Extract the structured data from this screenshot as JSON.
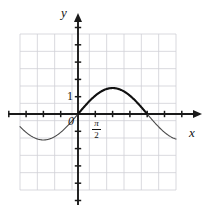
{
  "figure": {
    "kind": "coordinate-grid-graph",
    "background": "#ffffff",
    "grid_color": "#cfcfd6",
    "axis_color": "#1a1a1a",
    "curve_color": "#3a3a3a",
    "curve_color_bold": "#111111"
  },
  "labels": {
    "y_axis": "y",
    "x_axis": "x",
    "origin": "0",
    "y_one": "1",
    "x_tick_numerator": "π",
    "x_tick_denominator": "2"
  },
  "chart_data": {
    "type": "line",
    "title": "",
    "xlabel": "x",
    "ylabel": "y",
    "grid": true,
    "legend": false,
    "origin_px": {
      "x": 78,
      "y": 114
    },
    "cell_px": 17.3,
    "grid_bounds_px": {
      "left": 20,
      "top": 34,
      "right": 176,
      "bottom": 190
    },
    "grid_cells": {
      "cols": 9,
      "rows": 9
    },
    "units_per_cell": {
      "x": 0.7853981634,
      "y": 1
    },
    "x_ticks": [
      {
        "value": 1.5707963268,
        "label": "π/2",
        "px": 95.3
      }
    ],
    "y_ticks": [
      {
        "value": 1,
        "label": "1",
        "px": 96.7
      }
    ],
    "xlim": [
      -3.3,
      3.9
    ],
    "ylim": [
      -4.6,
      4.6
    ],
    "series": [
      {
        "name": "y = 1.5 sin(x)",
        "function": "sine",
        "amplitude": 1.5,
        "period_units": 6.2831853072,
        "period_cells": 4,
        "phase": 0,
        "samples_x_px_start": 20,
        "samples_x_px_end": 176,
        "bold_segment_px": {
          "start": 78,
          "end": 147.2
        },
        "bold_segment_units": {
          "start": 0,
          "end": 6.2831853072
        }
      }
    ],
    "annotations": [
      {
        "text": "y",
        "px": {
          "x": 64,
          "y": 12
        }
      },
      {
        "text": "x",
        "px": {
          "x": 192,
          "y": 132
        }
      },
      {
        "text": "1",
        "px": {
          "x": 70,
          "y": 96
        }
      },
      {
        "text": "0",
        "px": {
          "x": 71,
          "y": 121
        }
      },
      {
        "text": "π/2",
        "px": {
          "x": 96,
          "y": 127
        }
      }
    ]
  }
}
